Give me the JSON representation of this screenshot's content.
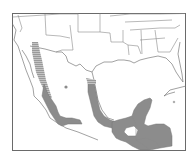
{
  "map": {
    "type": "species-range-map",
    "region": "Mexico, southern United States and Central America",
    "colors": {
      "background": "#ffffff",
      "frame": "#6a6a6a",
      "boundaries": "#8a8a8a",
      "range_fill": "#8c8c8c",
      "range_hatch": "#a8a8a8"
    },
    "legend": null,
    "labels": []
  }
}
